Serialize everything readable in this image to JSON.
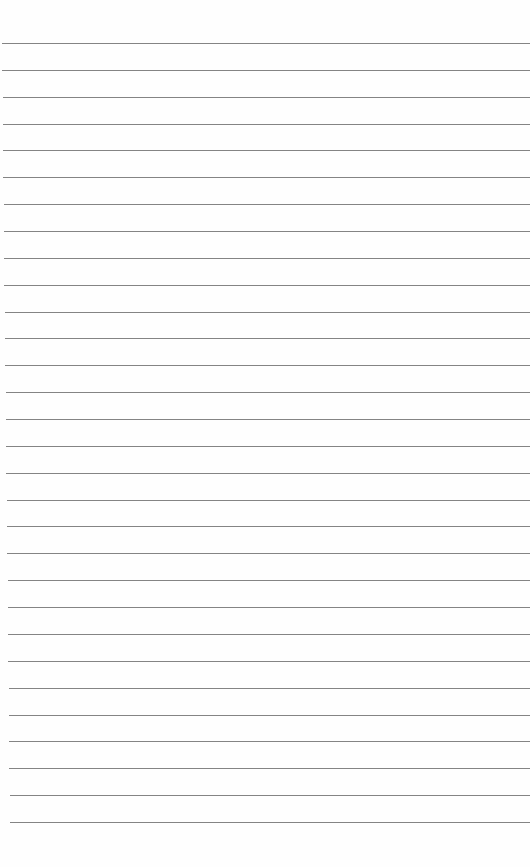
{
  "page": {
    "type": "blank lined paper",
    "line_count": 30,
    "first_line_y": 43,
    "line_spacing": 26.86,
    "line_left": 2,
    "line_left_bottom": 10,
    "line_right": 530,
    "line_color": "#6e6e6e",
    "background_color": "#fefefe"
  }
}
